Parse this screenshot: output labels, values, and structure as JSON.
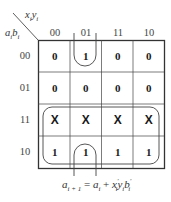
{
  "kmap": {
    "col_var_label": "xᵢyᵢ",
    "row_var_label": "aᵢbᵢ",
    "col_headers": [
      "00",
      "01",
      "11",
      "10"
    ],
    "row_headers": [
      "00",
      "01",
      "11",
      "10"
    ],
    "cells": [
      [
        "0",
        "1",
        "0",
        "0"
      ],
      [
        "0",
        "0",
        "0",
        "0"
      ],
      [
        "X",
        "X",
        "X",
        "X"
      ],
      [
        "1",
        "1",
        "1",
        "1"
      ]
    ],
    "groupings": [
      {
        "name": "row-11-10-group",
        "description": "rows 11 and 10 all columns (a_i)"
      },
      {
        "name": "column-01-wrap-group",
        "description": "column 01, rows 00 and 10 wrap-around (x'_i y_i b'_i)"
      }
    ]
  },
  "equation": {
    "lhs": "a",
    "lhs_sub": "i + 1",
    "equals": "=",
    "t1": "a",
    "t1_sub": "i",
    "plus": "+",
    "x": "x",
    "x_sup": "′",
    "x_sub": "i",
    "y": "y",
    "y_sub": "i",
    "b": "b",
    "b_sup": "′",
    "b_sub": "i"
  },
  "colors": {
    "grid": "#333333",
    "text": "#1a1a1a",
    "labels": "#444444"
  }
}
